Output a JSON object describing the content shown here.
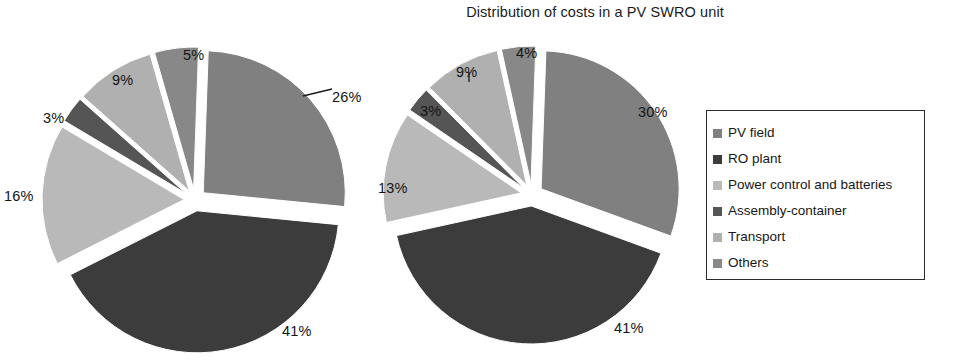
{
  "chart_data": [
    {
      "type": "pie",
      "title": "Distribution of costs in a PV SWRO unit",
      "name": "left-pie",
      "exploded": true,
      "categories": [
        "PV field",
        "RO plant",
        "Power control and batteries",
        "Assembly-container",
        "Transport",
        "Others"
      ],
      "values": [
        26,
        41,
        16,
        3,
        9,
        5
      ],
      "labels": [
        "26%",
        "41%",
        "16%",
        "3%",
        "9%",
        "5%"
      ],
      "colors": [
        "#808080",
        "#3c3c3c",
        "#b9b9b9",
        "#555555",
        "#b0b0b0",
        "#888888"
      ],
      "legend_position": "right",
      "grid": false
    },
    {
      "type": "pie",
      "title": "Distribution of costs in a PV SWRO unit",
      "name": "right-pie",
      "exploded": true,
      "categories": [
        "PV field",
        "RO plant",
        "Power control and batteries",
        "Assembly-container",
        "Transport",
        "Others"
      ],
      "values": [
        30,
        41,
        13,
        3,
        9,
        4
      ],
      "labels": [
        "30%",
        "41%",
        "13%",
        "3%",
        "9%",
        "4%"
      ],
      "colors": [
        "#808080",
        "#3c3c3c",
        "#b9b9b9",
        "#555555",
        "#b0b0b0",
        "#888888"
      ],
      "legend_position": "right",
      "grid": false
    }
  ],
  "title": "Distribution of costs in a PV SWRO unit",
  "legend": {
    "items": [
      {
        "label": "PV field",
        "color": "#808080"
      },
      {
        "label": "RO plant",
        "color": "#3c3c3c"
      },
      {
        "label": "Power control and batteries",
        "color": "#b9b9b9"
      },
      {
        "label": "Assembly-container",
        "color": "#555555"
      },
      {
        "label": "Transport",
        "color": "#b0b0b0"
      },
      {
        "label": "Others",
        "color": "#888888"
      }
    ]
  },
  "left_pie": {
    "labels": {
      "pv_field": "26%",
      "ro_plant": "41%",
      "power_control": "16%",
      "assembly": "3%",
      "transport": "9%",
      "others": "5%"
    }
  },
  "right_pie": {
    "labels": {
      "pv_field": "30%",
      "ro_plant": "41%",
      "power_control": "13%",
      "assembly": "3%",
      "transport": "9%",
      "others": "4%"
    }
  }
}
